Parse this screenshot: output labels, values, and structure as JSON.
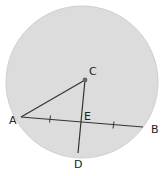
{
  "diagram": {
    "type": "circle-geometry",
    "circle": {
      "fill": "#dcdcdc",
      "stroke": "#cfcfcf"
    },
    "points": {
      "A": {
        "label": "A"
      },
      "B": {
        "label": "B"
      },
      "C": {
        "label": "C",
        "note": "center"
      },
      "D": {
        "label": "D"
      },
      "E": {
        "label": "E"
      }
    },
    "segments": [
      "AB",
      "CA",
      "CD"
    ],
    "tick_marks": "AE = EB",
    "colors": {
      "line": "#333333",
      "center_dot": "#666666"
    }
  }
}
